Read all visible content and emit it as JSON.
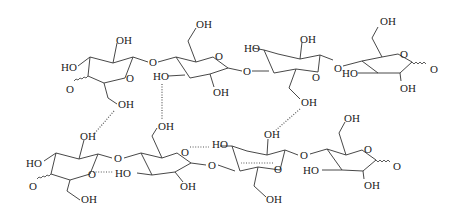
{
  "diagram": {
    "type": "chemical-structure",
    "colors": {
      "bond": "#333333",
      "text": "#222222",
      "background": "#ffffff"
    },
    "labels": {
      "OH": "OH",
      "HO": "HO",
      "O": "O"
    },
    "top_chain": {
      "units": 4,
      "left_end_label": "O",
      "right_end_label": "O"
    },
    "bottom_chain": {
      "units": 4,
      "left_end_label": "O",
      "right_end_label": "O"
    },
    "hydrogen_bonds": 8
  }
}
